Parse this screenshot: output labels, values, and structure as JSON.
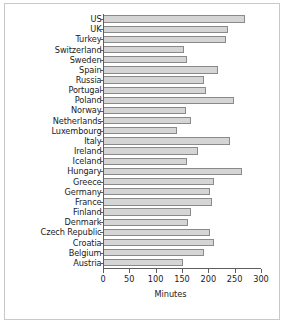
{
  "chart_data": {
    "type": "bar",
    "orientation": "horizontal",
    "title": "",
    "xlabel": "Minutes",
    "ylabel": "",
    "xlim": [
      0,
      300
    ],
    "xticks": [
      0,
      50,
      100,
      150,
      200,
      250,
      300
    ],
    "xtick_labels": [
      "0",
      "50",
      "100",
      "150",
      "200",
      "250",
      "300"
    ],
    "grid": false,
    "legend": null,
    "bar_fill_color": "#d5d5d5",
    "bar_edge_color": "#8a8a8a",
    "axis_color": "#5e5e5e",
    "frame_color": "#c9c9c9",
    "categories": [
      "US",
      "UK",
      "Turkey",
      "Switzerland",
      "Sweden",
      "Spain",
      "Russia",
      "Portugal",
      "Poland",
      "Norway",
      "Netherlands",
      "Luxembourg",
      "Italy",
      "Ireland",
      "Iceland",
      "Hungary",
      "Greece",
      "Germany",
      "France",
      "Finland",
      "Denmark",
      "Czech Republic",
      "Croatia",
      "Belgium",
      "Austria"
    ],
    "values": [
      270,
      238,
      233,
      153,
      159,
      219,
      191,
      195,
      248,
      157,
      168,
      141,
      241,
      181,
      159,
      263,
      210,
      203,
      207,
      167,
      162,
      204,
      210,
      192,
      151
    ]
  }
}
